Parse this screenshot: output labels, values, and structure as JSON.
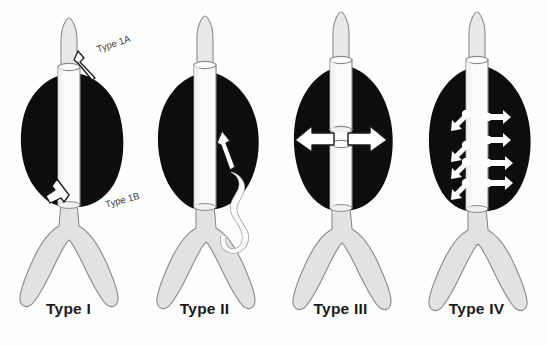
{
  "figure": {
    "background_color": "#ffffff",
    "colors": {
      "aneurysm_sac": "#0d0d0d",
      "vessel_fill": "#e2e2e2",
      "graft_fill": "#fbfbfb",
      "outline": "#8a8a8a",
      "arrow_fill": "#ffffff",
      "arrow_outline": "#1a1a1a",
      "caption_text": "#1a1a1a",
      "annotation_text": "#3a3a3a"
    }
  },
  "panels": [
    {
      "id": "panel-1",
      "caption": "Type I",
      "description": "Attachment site leak at proximal and distal graft seal zones",
      "annotations": [
        {
          "label": "Type 1A",
          "position": "proximal-right",
          "arrow": "up-right"
        },
        {
          "label": "Type 1B",
          "position": "distal-left",
          "arrow": "up-left"
        }
      ],
      "arrow_count": 2
    },
    {
      "id": "panel-2",
      "caption": "Type II",
      "description": "Retrograde flow into the sac from a tortuous collateral branch vessel",
      "annotations": [],
      "arrow_count": 1
    },
    {
      "id": "panel-3",
      "caption": "Type III",
      "description": "Modular junction separation or graft fabric defect with bidirectional flow",
      "annotations": [],
      "arrow_count": 2
    },
    {
      "id": "panel-4",
      "caption": "Type IV",
      "description": "Graft wall porosity with multiple small transmural jets",
      "annotations": [],
      "arrow_count": 8
    }
  ]
}
